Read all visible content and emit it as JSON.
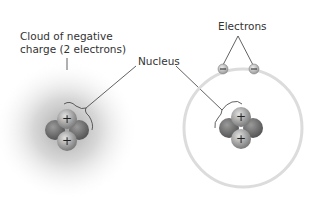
{
  "diagram": {
    "left_model": {
      "cloud_label": "Cloud of negative",
      "cloud_label_line2": "charge (2 electrons)",
      "cloud_color": "#9a9a9a"
    },
    "nucleus_label": "Nucleus",
    "right_model": {
      "electrons_label": "Electrons",
      "electron_symbol": "−",
      "orbit_color": "#dcdcdc"
    },
    "proton_symbol": "+",
    "colors": {
      "proton": "#9b9b9b",
      "neutron": "#6e6e6e",
      "line": "#3a3a3a",
      "text": "#333333"
    }
  }
}
